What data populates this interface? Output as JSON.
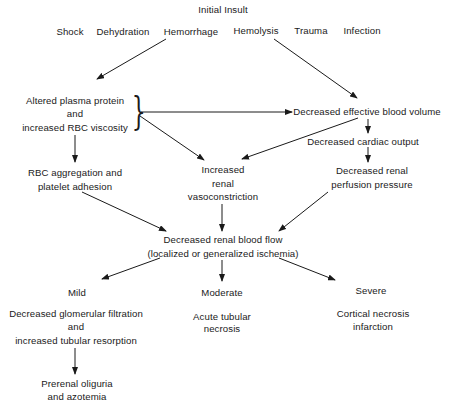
{
  "title": "Initial Insult",
  "causes": [
    "Shock",
    "Dehydration",
    "Hemorrhage",
    "Hemolysis",
    "Trauma",
    "Infection"
  ],
  "nodes": {
    "altered_plasma": [
      "Altered plasma protein",
      "and",
      "increased RBC viscosity"
    ],
    "decreased_effective_volume": "Decreased effective blood volume",
    "decreased_cardiac_output": "Decreased cardiac output",
    "decreased_perfusion": [
      "Decreased renal",
      "perfusion pressure"
    ],
    "rbc_aggregation": [
      "RBC aggregation and",
      "platelet adhesion"
    ],
    "increased_vasoconstriction": [
      "Increased",
      "renal",
      "vasoconstriction"
    ],
    "decreased_blood_flow": [
      "Decreased renal blood flow",
      "(localized or generalized ischemia)"
    ]
  },
  "severity": {
    "mild": {
      "label": "Mild",
      "outcome": [
        "Decreased glomerular filtration",
        "and",
        "increased tubular resorption"
      ],
      "result": [
        "Prerenal oliguria",
        "and azotemia"
      ]
    },
    "moderate": {
      "label": "Moderate",
      "outcome": [
        "Acute tubular",
        "necrosis"
      ]
    },
    "severe": {
      "label": "Severe",
      "outcome": [
        "Cortical necrosis",
        "infarction"
      ]
    }
  },
  "colors": {
    "ink": "#1a1a1a",
    "background": "#ffffff"
  }
}
